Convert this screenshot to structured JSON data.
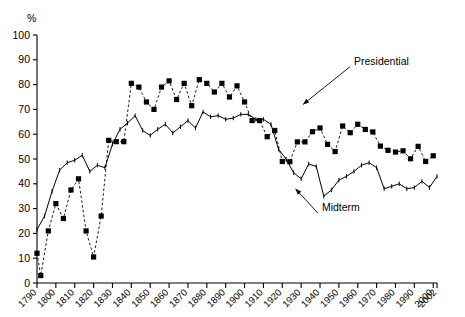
{
  "chart_data": {
    "type": "line",
    "title": "",
    "xlabel": "",
    "ylabel": "",
    "unit_label": "%",
    "ylim": [
      0,
      100
    ],
    "xlim": [
      1790,
      2002
    ],
    "grid": false,
    "legend_position": "annotated-inline",
    "y_ticks": [
      "0",
      "10",
      "20",
      "30",
      "40",
      "50",
      "60",
      "70",
      "80",
      "90",
      "100"
    ],
    "y_tick_values": [
      0,
      10,
      20,
      30,
      40,
      50,
      60,
      70,
      80,
      90,
      100
    ],
    "x_ticks": [
      "1790",
      "1800",
      "1810",
      "1820",
      "1830",
      "1840",
      "1850",
      "1860",
      "1870",
      "1880",
      "1890",
      "1900",
      "1910",
      "1920",
      "1930",
      "1940",
      "1950",
      "1960",
      "1970",
      "1980",
      "1990",
      "2000",
      "2002"
    ],
    "x_tick_values": [
      1790,
      1800,
      1810,
      1820,
      1830,
      1840,
      1850,
      1860,
      1870,
      1880,
      1890,
      1900,
      1910,
      1920,
      1930,
      1940,
      1950,
      1960,
      1970,
      1980,
      1990,
      2000,
      2002
    ],
    "annotations": [
      {
        "text": "Presidential",
        "x": 1958,
        "y": 88,
        "arrow_to_x": 1931,
        "arrow_to_y": 72
      },
      {
        "text": "Midterm",
        "x": 1941,
        "y": 29,
        "arrow_to_x": 1927,
        "arrow_to_y": 38
      }
    ],
    "series": [
      {
        "name": "Presidential",
        "marker": "square",
        "linestyle": "dashed",
        "x": [
          1790,
          1792,
          1796,
          1800,
          1804,
          1808,
          1812,
          1816,
          1820,
          1824,
          1828,
          1832,
          1836,
          1840,
          1844,
          1848,
          1852,
          1856,
          1860,
          1864,
          1868,
          1872,
          1876,
          1880,
          1884,
          1888,
          1892,
          1896,
          1900,
          1904,
          1908,
          1912,
          1916,
          1920,
          1924,
          1928,
          1932,
          1936,
          1940,
          1944,
          1948,
          1952,
          1956,
          1960,
          1964,
          1968,
          1972,
          1976,
          1980,
          1984,
          1988,
          1992,
          1996,
          2000
        ],
        "values": [
          12,
          3,
          21,
          32,
          26,
          37.5,
          42,
          21,
          10.5,
          27,
          57.5,
          57,
          57,
          80.5,
          79,
          73,
          70,
          79,
          81.5,
          74,
          80.5,
          71.5,
          82,
          80.5,
          77,
          80.5,
          75,
          79.5,
          73,
          65.5,
          65.5,
          59,
          61.5,
          49,
          48.9,
          56.9,
          56.9,
          61,
          62.5,
          55.9,
          53,
          63.3,
          60.6,
          64,
          61.9,
          60.9,
          55.2,
          53.5,
          52.8,
          53.3,
          50.1,
          55.1,
          49,
          51.3
        ]
      },
      {
        "name": "Midterm",
        "marker": "tick",
        "linestyle": "solid",
        "x": [
          1790,
          1794,
          1798,
          1802,
          1806,
          1810,
          1814,
          1818,
          1822,
          1826,
          1830,
          1834,
          1838,
          1842,
          1846,
          1850,
          1854,
          1858,
          1862,
          1866,
          1870,
          1874,
          1878,
          1882,
          1886,
          1890,
          1894,
          1898,
          1902,
          1906,
          1910,
          1914,
          1918,
          1922,
          1926,
          1930,
          1934,
          1938,
          1942,
          1946,
          1950,
          1954,
          1958,
          1962,
          1966,
          1970,
          1974,
          1978,
          1982,
          1986,
          1990,
          1994,
          1998,
          2002
        ],
        "values": [
          21.5,
          27,
          37,
          45.5,
          48.5,
          49.5,
          51.5,
          45,
          47.5,
          46.5,
          56,
          62,
          64.5,
          67.5,
          61.5,
          59.5,
          62,
          64,
          60.5,
          63,
          65.5,
          62.5,
          69,
          67,
          67.5,
          66,
          66.5,
          68,
          68,
          66,
          66,
          64,
          54,
          50,
          44.5,
          42,
          48,
          47,
          35,
          37.5,
          41.5,
          43,
          45,
          47.5,
          48.5,
          46.5,
          38,
          39,
          40,
          38,
          38.5,
          41,
          38.5,
          43
        ]
      }
    ]
  }
}
